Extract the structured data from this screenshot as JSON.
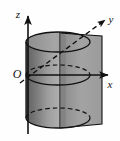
{
  "figure": {
    "background_color": "#fefefe",
    "stroke_color": "#111111",
    "labels": {
      "z_axis": "z",
      "y_axis": "y",
      "x_axis": "x",
      "origin": "O"
    },
    "colors": {
      "cylinder_dark": "#6e6e6e",
      "cylinder_mid": "#8d8d8d",
      "cylinder_light": "#b9b9b9",
      "plane_fill": "#9a9a9a",
      "plane_light": "#a8a8a8",
      "outline": "#111111"
    },
    "geometry": {
      "origin_px": [
        28,
        75
      ],
      "z_axis_top_px": [
        28,
        14
      ],
      "z_axis_bottom_px": [
        28,
        134
      ],
      "x_axis_tip_px": [
        110,
        75
      ],
      "y_axis_tip_px": [
        107,
        18
      ],
      "cylinder_top_center_px": [
        58,
        42
      ],
      "cylinder_bottom_center_px": [
        58,
        118
      ],
      "cylinder_rx_px": 32,
      "cylinder_ry_px": 10,
      "plane_left_px": 60,
      "plane_right_px": 102,
      "plane_top_px": 33,
      "plane_bottom_px": 128
    }
  }
}
